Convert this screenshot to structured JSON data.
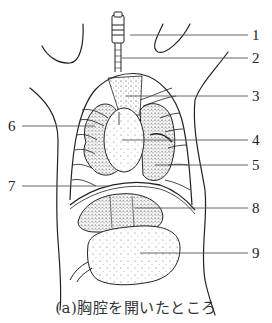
{
  "diagram": {
    "caption": "(a)胸腔を開いたところ",
    "labels": [
      {
        "id": "1",
        "text": "1",
        "x": 252,
        "y": 28,
        "line_from_x": 130,
        "line_y": 35
      },
      {
        "id": "2",
        "text": "2",
        "x": 252,
        "y": 51,
        "line_from_x": 122,
        "line_y": 58
      },
      {
        "id": "3",
        "text": "3",
        "x": 252,
        "y": 89,
        "line_from_x": 126,
        "line_y": 96
      },
      {
        "id": "4",
        "text": "4",
        "x": 252,
        "y": 133,
        "line_from_x": 122,
        "line_y": 140
      },
      {
        "id": "5",
        "text": "5",
        "x": 252,
        "y": 158,
        "line_from_x": 155,
        "line_y": 165
      },
      {
        "id": "6",
        "text": "6",
        "x": 8,
        "y": 119,
        "line_to_x": 95,
        "line_y": 126
      },
      {
        "id": "7",
        "text": "7",
        "x": 8,
        "y": 179,
        "line_to_x": 110,
        "line_y": 186
      },
      {
        "id": "8",
        "text": "8",
        "x": 252,
        "y": 201,
        "line_from_x": 135,
        "line_y": 208
      },
      {
        "id": "9",
        "text": "9",
        "x": 252,
        "y": 246,
        "line_from_x": 140,
        "line_y": 253
      }
    ],
    "colors": {
      "ink": "#222222",
      "background": "#ffffff",
      "leader_line": "#555555"
    }
  }
}
